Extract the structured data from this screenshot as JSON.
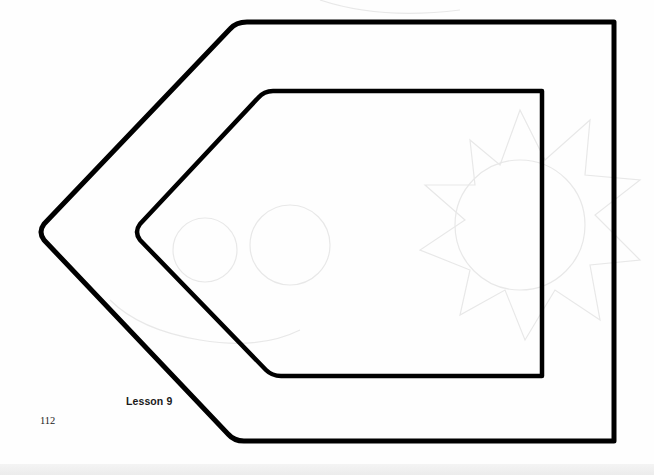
{
  "page": {
    "lesson_label": "Lesson 9",
    "page_number": "112"
  },
  "figure": {
    "stroke_color": "#000000",
    "outer_shape": {
      "points": [
        [
          238,
          22
        ],
        [
          614,
          22
        ],
        [
          614,
          441
        ],
        [
          235,
          441
        ],
        [
          40,
          232
        ]
      ]
    },
    "inner_shape": {
      "points": [
        [
          265,
          91
        ],
        [
          542,
          91
        ],
        [
          542,
          376
        ],
        [
          272,
          376
        ],
        [
          136,
          232
        ]
      ]
    }
  },
  "colors": {
    "background": "#fefefe",
    "ink": "#000000",
    "ghost_sketch": "#e6e6e6"
  }
}
